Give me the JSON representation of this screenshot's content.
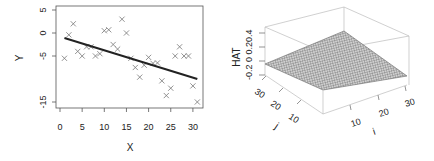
{
  "chart_data": [
    {
      "type": "scatter",
      "title": "",
      "xlabel": "X",
      "ylabel": "Y",
      "xlim": [
        0,
        31
      ],
      "ylim": [
        -16,
        5.5
      ],
      "xticks": [
        "0",
        "5",
        "10",
        "15",
        "20",
        "25",
        "30"
      ],
      "yticks": [
        "5",
        "0",
        "-5",
        "-15"
      ],
      "ytick_values": [
        5,
        0,
        -5,
        -15
      ],
      "xtick_values": [
        0,
        5,
        10,
        15,
        20,
        25,
        30
      ],
      "marker": "x",
      "grid": false,
      "legend": null,
      "points": [
        [
          1,
          -5.5
        ],
        [
          2,
          -0.4
        ],
        [
          3,
          2
        ],
        [
          4,
          -4
        ],
        [
          5,
          -5
        ],
        [
          6,
          -3
        ],
        [
          7,
          -3
        ],
        [
          8,
          -5
        ],
        [
          9,
          -4.5
        ],
        [
          10,
          0.5
        ],
        [
          11,
          0.7
        ],
        [
          12,
          -2.5
        ],
        [
          13,
          -3.5
        ],
        [
          14,
          3
        ],
        [
          15,
          0
        ],
        [
          16,
          -5.5
        ],
        [
          17,
          -7.5
        ],
        [
          18,
          -9.6
        ],
        [
          19,
          -7
        ],
        [
          20,
          -5.3
        ],
        [
          21,
          -6.6
        ],
        [
          22,
          -6.5
        ],
        [
          23,
          -10.4
        ],
        [
          24,
          -13.6
        ],
        [
          25,
          -12
        ],
        [
          26,
          -5
        ],
        [
          27,
          -3
        ],
        [
          28,
          -5
        ],
        [
          29,
          -5
        ],
        [
          30,
          -11.5
        ],
        [
          31,
          -15
        ]
      ],
      "fit_line": {
        "x": [
          1,
          31
        ],
        "y": [
          -1.1,
          -10.0
        ]
      }
    },
    {
      "type": "surface3d",
      "title": "",
      "xlabel": "i",
      "ylabel": "j",
      "zlabel": "HAT",
      "xticks": [
        "10",
        "20",
        "30"
      ],
      "yticks": [
        "10",
        "20",
        "30"
      ],
      "zticks": [
        "-0.2",
        "0",
        "0.2",
        "0.4"
      ],
      "description": "Perspective surface of hat-matrix values over i,j in 1..31; planar surface rising toward the back corner"
    }
  ],
  "left_plot": {
    "ylabel": "Y",
    "xlabel": "X",
    "xticks": [
      "0",
      "5",
      "10",
      "15",
      "20",
      "25",
      "30"
    ],
    "yticks": [
      "5",
      "0",
      "-5",
      "-15"
    ]
  },
  "right_plot": {
    "zlabel": "HAT",
    "zticks_text": "-0.2 0 0.20.4",
    "j_label": "j",
    "i_label": "i",
    "j_ticks": [
      "30",
      "20",
      "10"
    ],
    "i_ticks": [
      "10",
      "20",
      "30"
    ]
  }
}
